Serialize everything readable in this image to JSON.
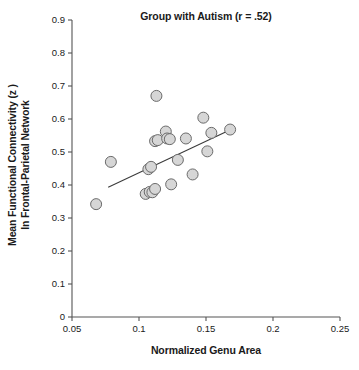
{
  "chart_data": {
    "type": "scatter",
    "title": "Group with Autism (r = .52)",
    "xlabel": "Normalized Genu Area",
    "ylabel_line1": "Mean Functional Connectivity (z )",
    "ylabel_line2": "In Frontal-Parietal Network",
    "correlation_r": ".52",
    "grid": false,
    "legend": "none",
    "xlim": [
      0.05,
      0.25
    ],
    "ylim": [
      0.0,
      0.9
    ],
    "xticks": [
      0.05,
      0.1,
      0.15,
      0.2,
      0.25
    ],
    "xticklabels": [
      "0.05",
      "0.1",
      "0.15",
      "0.2",
      "0.25"
    ],
    "yticks": [
      0,
      0.1,
      0.2,
      0.3,
      0.4,
      0.5,
      0.6,
      0.7,
      0.8,
      0.9
    ],
    "yticklabels": [
      "0",
      "0.1",
      "0.2",
      "0.3",
      "0.4",
      "0.5",
      "0.6",
      "0.7",
      "0.8",
      "0.9"
    ],
    "marker": {
      "shape": "circle",
      "fill": "#d6d6d6",
      "edge": "#6b6b6b",
      "size_px": 11
    },
    "points": [
      {
        "x": 0.068,
        "y": 0.342
      },
      {
        "x": 0.079,
        "y": 0.47
      },
      {
        "x": 0.105,
        "y": 0.373
      },
      {
        "x": 0.108,
        "y": 0.379
      },
      {
        "x": 0.11,
        "y": 0.378
      },
      {
        "x": 0.112,
        "y": 0.388
      },
      {
        "x": 0.107,
        "y": 0.448
      },
      {
        "x": 0.109,
        "y": 0.455
      },
      {
        "x": 0.112,
        "y": 0.533
      },
      {
        "x": 0.114,
        "y": 0.536
      },
      {
        "x": 0.113,
        "y": 0.67
      },
      {
        "x": 0.12,
        "y": 0.562
      },
      {
        "x": 0.121,
        "y": 0.541
      },
      {
        "x": 0.123,
        "y": 0.539
      },
      {
        "x": 0.124,
        "y": 0.402
      },
      {
        "x": 0.129,
        "y": 0.476
      },
      {
        "x": 0.135,
        "y": 0.541
      },
      {
        "x": 0.14,
        "y": 0.432
      },
      {
        "x": 0.148,
        "y": 0.604
      },
      {
        "x": 0.151,
        "y": 0.502
      },
      {
        "x": 0.154,
        "y": 0.558
      },
      {
        "x": 0.168,
        "y": 0.568
      }
    ],
    "fit_line": {
      "x0": 0.077,
      "y0": 0.393,
      "x1": 0.169,
      "y1": 0.569,
      "color": "#3a3a3a"
    }
  }
}
